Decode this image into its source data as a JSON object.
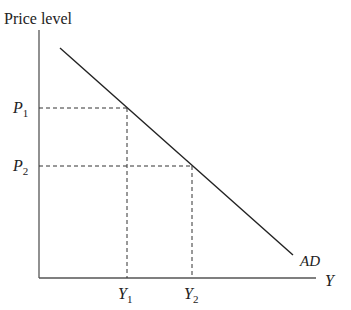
{
  "diagram": {
    "y_axis_label": "Price level",
    "x_axis_label": "Y",
    "curve_label": "AD",
    "price_levels": [
      {
        "symbol": "P",
        "subscript": "1"
      },
      {
        "symbol": "P",
        "subscript": "2"
      }
    ],
    "outputs": [
      {
        "symbol": "Y",
        "subscript": "1"
      },
      {
        "symbol": "Y",
        "subscript": "2"
      }
    ],
    "colors": {
      "line": "#222222",
      "axis": "#555555",
      "background": "#ffffff"
    }
  }
}
